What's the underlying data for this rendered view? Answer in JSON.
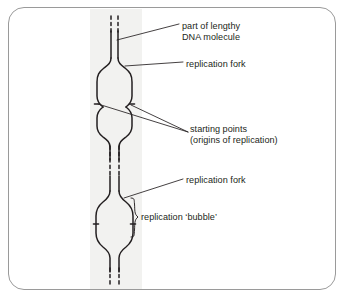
{
  "figure": {
    "type": "biology-diagram",
    "background_color": "#ffffff",
    "border_color": "#9a9a9a",
    "band_color": "#f2f2f0",
    "line_color": "#231f20",
    "text_color": "#231f20"
  },
  "labels": {
    "dna_molecule_line1": "part of lengthy",
    "dna_molecule_line2": "DNA molecule",
    "replication_fork_top": "replication fork",
    "origins_line1": "starting points",
    "origins_line2": "(origins of replication)",
    "replication_fork_bottom": "replication fork",
    "replication_bubble": "replication ‘bubble’"
  },
  "structures": {
    "strand_label": "dna-double-strand",
    "upper_bubble_label": "upper-replication-bubble",
    "middle_bubble_label": "middle-replication-bubble",
    "lower_bubble_label": "lower-replication-bubble",
    "origin_tick_count": 4,
    "brace_label": "bubble-extent-brace"
  }
}
